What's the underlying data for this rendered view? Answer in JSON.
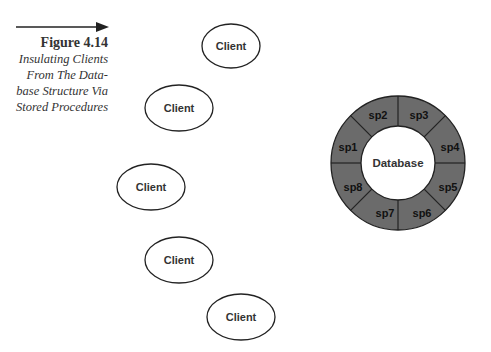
{
  "caption": {
    "figure_label": "Figure 4.14",
    "lines": [
      "Insulating Clients",
      "From The Data-",
      "base Structure Via",
      "Stored Procedures"
    ]
  },
  "clients": [
    {
      "label": "Client",
      "cx": 231,
      "cy": 46,
      "rx": 29,
      "ry": 22
    },
    {
      "label": "Client",
      "cx": 179,
      "cy": 108,
      "rx": 34,
      "ry": 23
    },
    {
      "label": "Client",
      "cx": 151,
      "cy": 187,
      "rx": 34,
      "ry": 23
    },
    {
      "label": "Client",
      "cx": 179,
      "cy": 260,
      "rx": 34,
      "ry": 23
    },
    {
      "label": "Client",
      "cx": 241,
      "cy": 317,
      "rx": 34,
      "ry": 23
    }
  ],
  "database": {
    "label": "Database",
    "ring_color": "#6b6b6b",
    "procedures": [
      "sp1",
      "sp2",
      "sp3",
      "sp4",
      "sp5",
      "sp6",
      "sp7",
      "sp8"
    ]
  }
}
